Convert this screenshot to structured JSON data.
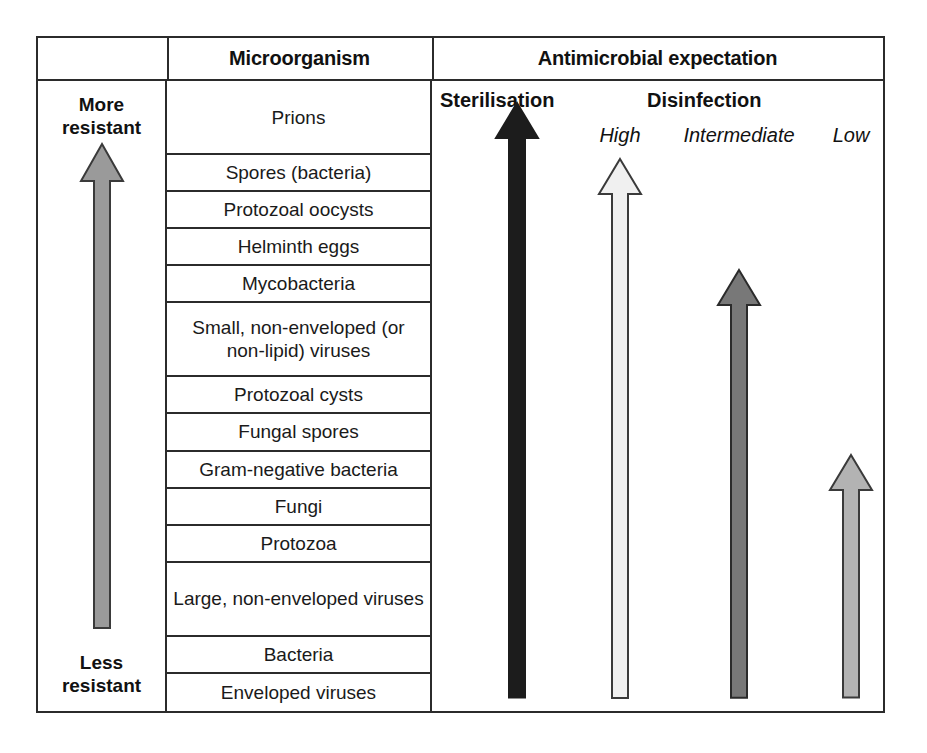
{
  "figure": {
    "header": {
      "blank_label": "",
      "microorganism_label": "Microorganism",
      "antimicrobial_label": "Antimicrobial expectation"
    },
    "resistance_axis": {
      "top_label": "More\nresistant",
      "top_label_line1": "More",
      "top_label_line2": "resistant",
      "bottom_label_line1": "Less",
      "bottom_label_line2": "resistant",
      "arrow_direction": "up",
      "arrow_color": "#9a9a9a",
      "arrow_outline": "#3a3a3a"
    },
    "microorganisms": [
      {
        "label": "Prions",
        "tall": true
      },
      {
        "label": "Spores (bacteria)",
        "tall": false
      },
      {
        "label": "Protozoal oocysts",
        "tall": false
      },
      {
        "label": "Helminth eggs",
        "tall": false
      },
      {
        "label": "Mycobacteria",
        "tall": false
      },
      {
        "label": "Small, non-enveloped (or non-lipid) viruses",
        "tall": true
      },
      {
        "label": "Protozoal cysts",
        "tall": false
      },
      {
        "label": "Fungal spores",
        "tall": false
      },
      {
        "label": "Gram-negative bacteria",
        "tall": false
      },
      {
        "label": "Fungi",
        "tall": false
      },
      {
        "label": "Protozoa",
        "tall": false
      },
      {
        "label": "Large, non-enveloped viruses",
        "tall": true
      },
      {
        "label": "Bacteria",
        "tall": false
      },
      {
        "label": "Enveloped viruses",
        "tall": false
      }
    ],
    "antimicrobial": {
      "groups": [
        {
          "label": "Sterilisation"
        },
        {
          "label": "Disinfection"
        }
      ],
      "levels": [
        {
          "label": "High"
        },
        {
          "label": "Intermediate"
        },
        {
          "label": "Low"
        }
      ],
      "arrows": [
        {
          "name": "sterilisation",
          "reaches_label": "Prions",
          "fill": "#1c1c1c",
          "outline": "#1c1c1c"
        },
        {
          "name": "high",
          "reaches_label": "Spores (bacteria)",
          "fill": "#f0f0f0",
          "outline": "#3a3a3a"
        },
        {
          "name": "intermediate",
          "reaches_label": "Mycobacteria",
          "fill": "#787878",
          "outline": "#2b2b2b"
        },
        {
          "name": "low",
          "reaches_label": "Gram-negative bacteria",
          "fill": "#b3b3b3",
          "outline": "#3a3a3a"
        }
      ]
    },
    "colors": {
      "border": "#2b2b2b",
      "background": "#ffffff",
      "text": "#111111"
    }
  }
}
